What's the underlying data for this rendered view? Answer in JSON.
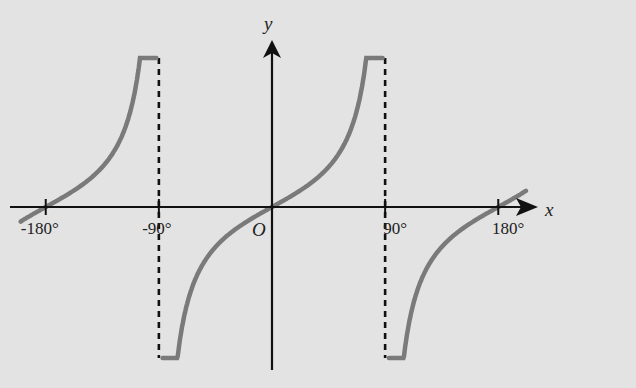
{
  "chart_data": {
    "type": "line",
    "title": "",
    "function": "y = tan x",
    "xlabel": "x",
    "ylabel": "y",
    "origin_label": "O",
    "x_ticks": [
      -180,
      -90,
      90,
      180
    ],
    "x_tick_labels": [
      "-180°",
      "-90°",
      "90°",
      "180°"
    ],
    "xlim": [
      -200,
      205
    ],
    "asymptotes": [
      -90,
      90
    ],
    "grid": false,
    "series": [
      {
        "name": "tan x branch 1",
        "x_range": [
          -200,
          -92
        ]
      },
      {
        "name": "tan x branch 2",
        "x_range": [
          -87,
          88
        ]
      },
      {
        "name": "tan x branch 3",
        "x_range": [
          93,
          202
        ]
      }
    ],
    "curve_color": "#7a7a7a",
    "axis_color": "#111111",
    "background": "#e3e3e3"
  }
}
